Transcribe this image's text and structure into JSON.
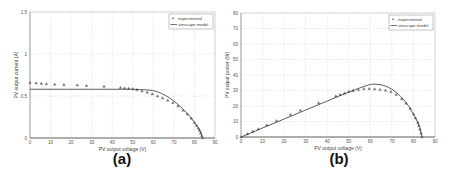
{
  "chart_data": [
    {
      "id": "a",
      "type": "scatter",
      "panel_label": "(a)",
      "title": "",
      "xlabel": "PV output voltage (V)",
      "ylabel": "PV output current (A)",
      "xlim": [
        0,
        90
      ],
      "ylim": [
        0,
        1.5
      ],
      "xticks": [
        0,
        10,
        20,
        30,
        40,
        50,
        60,
        70,
        80,
        90
      ],
      "yticks": [
        0,
        0.5,
        1,
        1.5
      ],
      "ytick_labels": [
        "0",
        "0.5",
        "1",
        "1.5"
      ],
      "grid": true,
      "legend": {
        "position": "upper right",
        "entries": [
          "experimental",
          "simscape model"
        ]
      },
      "series": [
        {
          "name": "experimental",
          "style": "markers",
          "x": [
            0,
            3,
            5.5,
            8,
            12,
            16.5,
            23,
            27.5,
            36,
            44,
            46,
            48,
            50,
            52,
            54.5,
            57,
            59.5,
            62,
            64.5,
            67,
            69.5,
            72,
            74.5,
            76.5,
            78.5,
            80,
            81,
            82,
            82.5,
            83,
            83.5,
            84
          ],
          "y": [
            0.66,
            0.655,
            0.65,
            0.645,
            0.64,
            0.635,
            0.63,
            0.625,
            0.615,
            0.6,
            0.595,
            0.59,
            0.585,
            0.575,
            0.56,
            0.545,
            0.525,
            0.5,
            0.475,
            0.45,
            0.42,
            0.38,
            0.33,
            0.285,
            0.235,
            0.185,
            0.15,
            0.115,
            0.09,
            0.06,
            0.03,
            0.0
          ]
        },
        {
          "name": "simscape model",
          "style": "line",
          "x": [
            0,
            40,
            50,
            55,
            58,
            60,
            62,
            64,
            66,
            68,
            70,
            72,
            74,
            76,
            78,
            80,
            82,
            83,
            84
          ],
          "y": [
            0.58,
            0.58,
            0.58,
            0.575,
            0.57,
            0.565,
            0.55,
            0.53,
            0.505,
            0.475,
            0.44,
            0.4,
            0.355,
            0.305,
            0.25,
            0.185,
            0.115,
            0.07,
            0.0
          ]
        }
      ]
    },
    {
      "id": "b",
      "type": "scatter",
      "panel_label": "(b)",
      "title": "",
      "xlabel": "PV output voltage (V)",
      "ylabel": "PV output power (W)",
      "xlim": [
        0,
        90
      ],
      "ylim": [
        0,
        80
      ],
      "xticks": [
        0,
        10,
        20,
        30,
        40,
        50,
        60,
        70,
        80,
        90
      ],
      "yticks": [
        0,
        10,
        20,
        30,
        40,
        50,
        60,
        70,
        80
      ],
      "ytick_labels": [
        "0",
        "10",
        "20",
        "30",
        "40",
        "50",
        "60",
        "70",
        "80"
      ],
      "grid": true,
      "legend": {
        "position": "upper right",
        "entries": [
          "experimental",
          "simscape model"
        ]
      },
      "series": [
        {
          "name": "experimental",
          "style": "markers",
          "x": [
            0,
            3,
            5.5,
            8,
            12,
            16.5,
            23,
            27.5,
            36,
            44,
            46,
            48,
            50,
            52,
            54.5,
            57,
            59.5,
            62,
            64.5,
            67,
            69.5,
            72,
            74.5,
            76.5,
            78.5,
            80,
            81,
            82,
            82.5,
            83,
            83.5,
            84
          ],
          "y": [
            0,
            2,
            3.6,
            5.2,
            7.7,
            10.5,
            14.5,
            17.2,
            22.1,
            26.4,
            27.4,
            28.3,
            29.3,
            29.9,
            30.5,
            31.1,
            31.2,
            31,
            30.6,
            30.2,
            29.2,
            27.4,
            24.6,
            21.8,
            18.4,
            14.8,
            12.2,
            9.4,
            7.4,
            5,
            2.5,
            0
          ]
        },
        {
          "name": "simscape model",
          "style": "line",
          "x": [
            0,
            10,
            20,
            30,
            40,
            50,
            55,
            58,
            60,
            62,
            64,
            66,
            68,
            70,
            72,
            74,
            76,
            78,
            80,
            82,
            83,
            84
          ],
          "y": [
            0,
            5.8,
            11.6,
            17.4,
            23.2,
            29,
            31.6,
            33.1,
            33.9,
            34.1,
            33.9,
            33.3,
            32.3,
            30.8,
            28.8,
            26.3,
            23.2,
            19.5,
            14.8,
            9.4,
            5.8,
            0
          ]
        }
      ]
    }
  ]
}
